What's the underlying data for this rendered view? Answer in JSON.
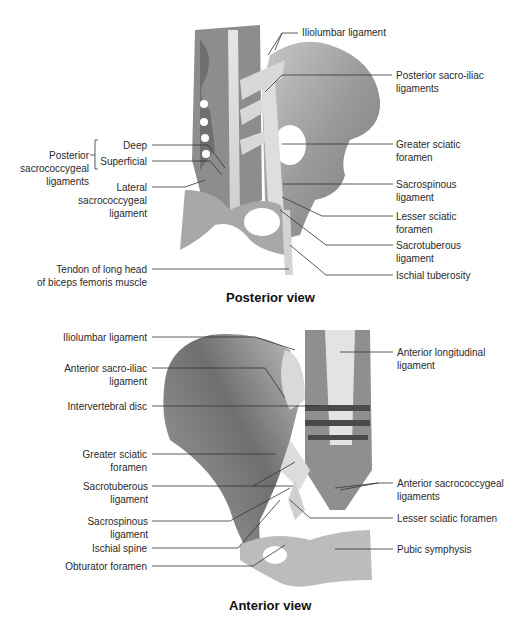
{
  "posterior": {
    "title": "Posterior view",
    "labels": {
      "iliolumbar": "Iliolumbar ligament",
      "post_sacroiliac": "Posterior sacro-iliac\nligaments",
      "greater_sciatic": "Greater sciatic\nforamen",
      "sacrospinous": "Sacrospinous\nligament",
      "lesser_sciatic": "Lesser sciatic\nforamen",
      "sacrotuberous": "Sacrotuberous\nligament",
      "ischial_tuberosity": "Ischial tuberosity",
      "post_sacrococcygeal": "Posterior\nsacrococcygeal\nligaments",
      "deep": "Deep",
      "superficial": "Superficial",
      "lateral_sacrococcygeal": "Lateral\nsacrococcygeal\nligament",
      "tendon": "Tendon of long head\nof biceps femoris muscle"
    }
  },
  "anterior": {
    "title": "Anterior view",
    "labels": {
      "iliolumbar": "Iliolumbar ligament",
      "ant_sacroiliac": "Anterior sacro-iliac\nligament",
      "intervertebral": "Intervertebral disc",
      "greater_sciatic": "Greater sciatic\nforamen",
      "sacrotuberous": "Sacrotuberous\nligament",
      "sacrospinous": "Sacrospinous\nligament",
      "ischial_spine": "Ischial spine",
      "obturator": "Obturator foramen",
      "ant_longitudinal": "Anterior longitudinal\nligament",
      "ant_sacrococcygeal": "Anterior sacrococcygeal\nligaments",
      "lesser_sciatic": "Lesser sciatic foramen",
      "pubic_symphysis": "Pubic symphysis"
    }
  }
}
